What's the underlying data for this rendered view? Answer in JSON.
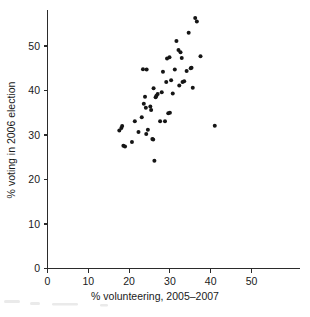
{
  "chart_data": {
    "type": "scatter",
    "title": "",
    "xlabel": "% volunteering, 2005–2007",
    "ylabel": "% voting in 2006 election",
    "xlim": [
      0,
      56
    ],
    "ylim": [
      0,
      58
    ],
    "xticks": [
      0,
      10,
      20,
      30,
      40,
      50
    ],
    "yticks": [
      0,
      10,
      20,
      30,
      40,
      50
    ],
    "xtick_labels": [
      "0",
      "10",
      "20",
      "30",
      "40",
      "50"
    ],
    "ytick_labels": [
      "0",
      "10",
      "20",
      "30",
      "40",
      "50"
    ],
    "grid": false,
    "legend": null,
    "marker": "filled-circle",
    "marker_color": "#151515",
    "axis_color": "#2b2b2b",
    "background_color": "#ffffff",
    "points": [
      {
        "x": 17.6,
        "y": 31.0
      },
      {
        "x": 18.1,
        "y": 31.6
      },
      {
        "x": 18.3,
        "y": 32.0
      },
      {
        "x": 18.6,
        "y": 27.6
      },
      {
        "x": 19.0,
        "y": 27.4
      },
      {
        "x": 20.7,
        "y": 28.4
      },
      {
        "x": 21.4,
        "y": 33.1
      },
      {
        "x": 22.3,
        "y": 30.7
      },
      {
        "x": 23.1,
        "y": 34.0
      },
      {
        "x": 23.4,
        "y": 44.8
      },
      {
        "x": 23.6,
        "y": 37.0
      },
      {
        "x": 23.9,
        "y": 38.6
      },
      {
        "x": 24.1,
        "y": 36.1
      },
      {
        "x": 24.2,
        "y": 30.2
      },
      {
        "x": 24.3,
        "y": 44.7
      },
      {
        "x": 24.6,
        "y": 31.2
      },
      {
        "x": 25.2,
        "y": 36.4
      },
      {
        "x": 25.4,
        "y": 35.6
      },
      {
        "x": 25.7,
        "y": 29.1
      },
      {
        "x": 25.9,
        "y": 29.0
      },
      {
        "x": 26.0,
        "y": 40.5
      },
      {
        "x": 26.2,
        "y": 24.2
      },
      {
        "x": 26.5,
        "y": 38.5
      },
      {
        "x": 26.7,
        "y": 38.8
      },
      {
        "x": 27.0,
        "y": 39.2
      },
      {
        "x": 27.6,
        "y": 33.1
      },
      {
        "x": 28.0,
        "y": 39.6
      },
      {
        "x": 28.3,
        "y": 44.2
      },
      {
        "x": 28.8,
        "y": 33.1
      },
      {
        "x": 29.1,
        "y": 41.9
      },
      {
        "x": 29.3,
        "y": 47.2
      },
      {
        "x": 29.6,
        "y": 34.9
      },
      {
        "x": 29.9,
        "y": 47.5
      },
      {
        "x": 30.0,
        "y": 35.0
      },
      {
        "x": 30.3,
        "y": 42.3
      },
      {
        "x": 30.7,
        "y": 39.3
      },
      {
        "x": 31.2,
        "y": 44.7
      },
      {
        "x": 31.6,
        "y": 51.1
      },
      {
        "x": 32.1,
        "y": 49.1
      },
      {
        "x": 32.3,
        "y": 41.1
      },
      {
        "x": 32.6,
        "y": 48.6
      },
      {
        "x": 32.9,
        "y": 47.3
      },
      {
        "x": 33.1,
        "y": 41.9
      },
      {
        "x": 33.5,
        "y": 42.1
      },
      {
        "x": 34.1,
        "y": 44.4
      },
      {
        "x": 34.6,
        "y": 53.0
      },
      {
        "x": 35.1,
        "y": 45.0
      },
      {
        "x": 35.3,
        "y": 45.1
      },
      {
        "x": 35.6,
        "y": 40.6
      },
      {
        "x": 36.2,
        "y": 56.3
      },
      {
        "x": 36.6,
        "y": 55.5
      },
      {
        "x": 37.5,
        "y": 47.7
      },
      {
        "x": 41.0,
        "y": 32.1
      }
    ]
  },
  "axes": {
    "x_title": "% volunteering, 2005–2007",
    "y_title": "% voting in 2006 election"
  }
}
